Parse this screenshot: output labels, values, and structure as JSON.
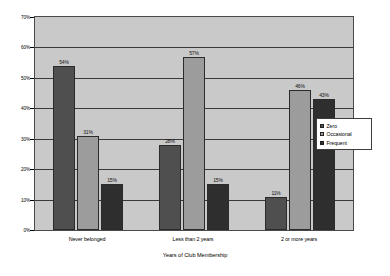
{
  "chart_data": {
    "type": "bar",
    "title": "",
    "xlabel": "Years of Club Membership",
    "ylabel": "",
    "ylim": [
      0,
      70
    ],
    "ytick_labels": [
      "0%",
      "10%",
      "20%",
      "30%",
      "40%",
      "50%",
      "60%",
      "70%"
    ],
    "ytick_values": [
      0,
      10,
      20,
      30,
      40,
      50,
      60,
      70
    ],
    "grid": true,
    "legend_position": "right",
    "categories": [
      "Never belonged",
      "Less than 2 years",
      "2 or more years"
    ],
    "series": [
      {
        "name": "Zero",
        "color": "#4f4f4f",
        "values": [
          54,
          28,
          11
        ],
        "labels": [
          "54%",
          "28%",
          "11%"
        ]
      },
      {
        "name": "Occasional",
        "color": "#9c9c9c",
        "values": [
          31,
          57,
          46
        ],
        "labels": [
          "31%",
          "57%",
          "46%"
        ]
      },
      {
        "name": "Frequent",
        "color": "#2e2e2e",
        "values": [
          15,
          15,
          43
        ],
        "labels": [
          "15%",
          "15%",
          "43%"
        ]
      }
    ]
  },
  "legend": {
    "items": [
      {
        "label": "Zero"
      },
      {
        "label": "Occasional"
      },
      {
        "label": "Frequent"
      }
    ]
  },
  "axis": {
    "x_title": "Years of Club Membership"
  },
  "colors": {
    "plot_background": "#c9c9c9",
    "plot_border": "#4a4a4a",
    "gridline": "#3a3a3a",
    "page_background": "#ffffff"
  }
}
